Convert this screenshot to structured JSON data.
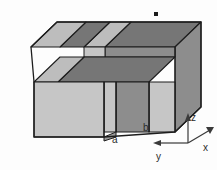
{
  "figure": {
    "type": "isometric-3d-diagram",
    "background_color": "#fdfdfd"
  },
  "colors": {
    "face_front_light": "#c6c6c6",
    "face_front_dark": "#8d8d8d",
    "face_top_light": "#bdbdbd",
    "face_top_dark": "#767676",
    "face_side_light": "#c2c2c2",
    "outline": "#1d1d1d",
    "axis": "#3a3a3a",
    "label_text": "#2b2b2b",
    "marker": "#1a1a1a"
  },
  "labels": {
    "a": "a",
    "b": "b",
    "x": "x",
    "y": "y",
    "z": "z"
  },
  "axes": {
    "z_direction": "up",
    "x_direction": "right-up-diagonal",
    "y_direction": "left-down-diagonal",
    "origin": {
      "x": 188,
      "y": 143
    }
  },
  "marker": {
    "shape": "small-filled-square",
    "x": 156,
    "y": 14,
    "size": 4
  },
  "slabs": [
    {
      "index": 0,
      "shade": "light",
      "label": "a"
    },
    {
      "index": 1,
      "shade": "dark",
      "label": "b"
    },
    {
      "index": 2,
      "shade": "light",
      "label": "a"
    },
    {
      "index": 3,
      "shade": "dark",
      "label": "b"
    }
  ]
}
